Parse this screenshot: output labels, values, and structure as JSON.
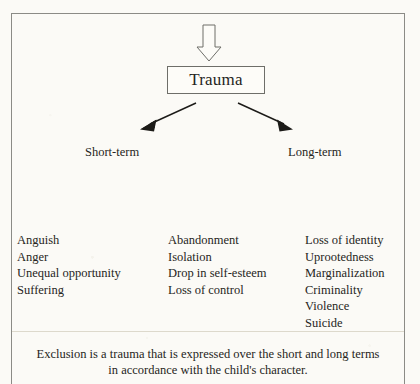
{
  "figure": {
    "background_color": "#fbfaf6",
    "ink_color": "#262522",
    "frame_color": "#8b8b86"
  },
  "top_arrow": {
    "icon": "hollow-down-arrow-icon",
    "direction": "down",
    "style": "outline"
  },
  "root_node": {
    "label": "Trauma"
  },
  "branches": [
    {
      "id": "short",
      "label": "Short-term",
      "arrow_icon": "diagonal-arrow-down-left-icon"
    },
    {
      "id": "long",
      "label": "Long-term",
      "arrow_icon": "diagonal-arrow-down-right-icon"
    }
  ],
  "columns": [
    {
      "id": "short-term-effects",
      "items": [
        "Anguish",
        "Anger",
        "Unequal opportunity",
        "Suffering"
      ]
    },
    {
      "id": "middle-effects",
      "items": [
        "Abandonment",
        "Isolation",
        "Drop in self-esteem",
        "Loss of control"
      ]
    },
    {
      "id": "long-term-effects",
      "items": [
        "Loss of identity",
        "Uprootedness",
        "Marginalization",
        "Criminality",
        "Violence",
        "Suicide"
      ]
    }
  ],
  "caption": {
    "line1": "Exclusion is a trauma that is expressed over the short and long terms",
    "line2": "in accordance with the child's character."
  }
}
